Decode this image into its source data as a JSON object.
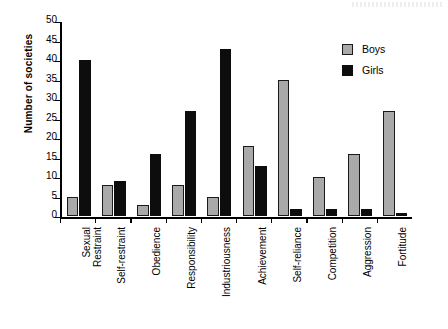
{
  "chart_data": {
    "type": "bar",
    "title": "",
    "subtitle": "",
    "xlabel": "",
    "ylabel": "Number of societies",
    "ylim": [
      0,
      50
    ],
    "yticks": [
      0,
      5,
      10,
      15,
      20,
      25,
      30,
      35,
      40,
      45,
      50
    ],
    "ytick_labels": [
      "0",
      "5",
      "10",
      "15",
      "20",
      "25",
      "30",
      "35",
      "40",
      "45",
      "50"
    ],
    "grid": false,
    "legend_position": "top-right",
    "categories": [
      "Sexual Restraint",
      "Self-restraint",
      "Obedience",
      "Responsibility",
      "Industriousness",
      "Achievement",
      "Self-reliance",
      "Competition",
      "Aggression",
      "Fortitude"
    ],
    "category_lines": [
      [
        "Sexual",
        "Restraint"
      ],
      [
        "Self-restraint"
      ],
      [
        "Obedience"
      ],
      [
        "Responsibility"
      ],
      [
        "Industriousness"
      ],
      [
        "Achievement"
      ],
      [
        "Self-reliance"
      ],
      [
        "Competition"
      ],
      [
        "Aggression"
      ],
      [
        "Fortitude"
      ]
    ],
    "series": [
      {
        "name": "Boys",
        "color": "#a9a9a9",
        "values": [
          5,
          8,
          3,
          8,
          5,
          18,
          35,
          10,
          16,
          27
        ]
      },
      {
        "name": "Girls",
        "color": "#0d0d0d",
        "values": [
          40,
          9,
          16,
          27,
          43,
          13,
          2,
          2,
          2,
          1
        ]
      }
    ]
  },
  "legend": {
    "items": [
      {
        "label": "Boys",
        "color": "#a9a9a9"
      },
      {
        "label": "Girls",
        "color": "#0d0d0d"
      }
    ]
  },
  "colors": {
    "boys": "#a9a9a9",
    "girls": "#0d0d0d",
    "axis": "#000000",
    "background": "#ffffff"
  }
}
